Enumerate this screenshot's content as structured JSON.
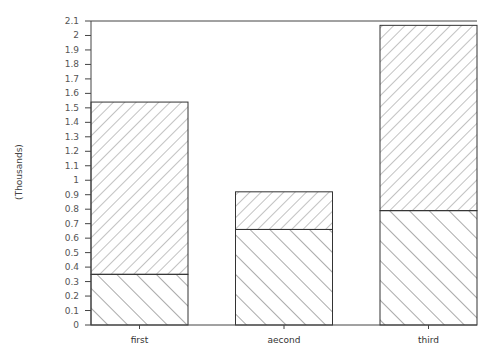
{
  "chart_data": {
    "type": "bar",
    "stacked": true,
    "title": "",
    "xlabel": "",
    "ylabel": "(Thousands)",
    "ylim": [
      0,
      2.1
    ],
    "yticks": [
      "0",
      "0.1",
      "0.2",
      "0.3",
      "0.4",
      "0.5",
      "0.6",
      "0.7",
      "0.8",
      "0.9",
      "1",
      "1.1",
      "1.2",
      "1.3",
      "1.4",
      "1.5",
      "1.6",
      "1.7",
      "1.8",
      "1.9",
      "2",
      "2.1"
    ],
    "ytick_values": [
      0,
      0.1,
      0.2,
      0.3,
      0.4,
      0.5,
      0.6,
      0.7,
      0.8,
      0.9,
      1.0,
      1.1,
      1.2,
      1.3,
      1.4,
      1.5,
      1.6,
      1.7,
      1.8,
      1.9,
      2.0,
      2.1
    ],
    "categories": [
      "first",
      "aecond",
      "third"
    ],
    "series": [
      {
        "name": "lower segment",
        "pattern": "backslash-hatch",
        "values": [
          0.35,
          0.66,
          0.79
        ]
      },
      {
        "name": "upper segment",
        "pattern": "forwardslash-hatch",
        "values": [
          1.19,
          0.26,
          1.28
        ]
      }
    ],
    "totals": [
      1.54,
      0.92,
      2.07
    ],
    "grid": false,
    "legend": "none"
  }
}
